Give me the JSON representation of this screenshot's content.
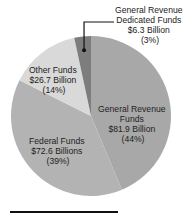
{
  "chart_data": {
    "type": "pie",
    "title": "",
    "start": "top",
    "direction": "clockwise",
    "slices": [
      {
        "name": "General Revenue Funds",
        "value": 81.9,
        "percent": 44,
        "value_label": "$81.9 Billion",
        "percent_label": "(44%)",
        "color": "#a8a8a8",
        "label_lines": [
          "General Revenue",
          "Funds",
          "$81.9 Billion",
          "(44%)"
        ]
      },
      {
        "name": "Federal Funds",
        "value": 72.6,
        "percent": 39,
        "value_label": "$72.6 Billions",
        "percent_label": "(39%)",
        "color": "#b3b3b3",
        "label_lines": [
          "Federal Funds",
          "$72.6 Billions",
          "(39%)"
        ]
      },
      {
        "name": "Other Funds",
        "value": 26.7,
        "percent": 14,
        "value_label": "$26.7 Billion",
        "percent_label": "(14%)",
        "color": "#d9d9d9",
        "label_lines": [
          "Other Funds",
          "$26.7 Billion",
          "(14%)"
        ]
      },
      {
        "name": "General Revenue Dedicated Funds",
        "value": 6.3,
        "percent": 3,
        "value_label": "$6.3 Billion",
        "percent_label": "(3%)",
        "color": "#7d7d7d",
        "label_lines": [
          "General Revenue",
          "Dedicated Funds",
          "$6.3 Billion",
          "(3%)"
        ]
      }
    ],
    "legend": "none",
    "callout": {
      "slice": "General Revenue Dedicated Funds",
      "style": "leader-line"
    }
  }
}
